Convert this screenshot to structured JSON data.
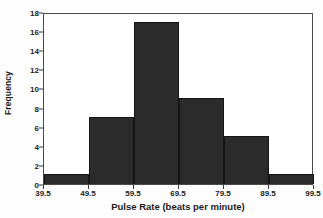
{
  "chart_data": {
    "type": "bar",
    "title": "",
    "xlabel": "Pulse Rate (beats per minute)",
    "ylabel": "Frequency",
    "categories": [
      "39.5-49.5",
      "49.5-59.5",
      "59.5-69.5",
      "69.5-79.5",
      "79.5-89.5",
      "89.5-99.5"
    ],
    "values": [
      1,
      7,
      17,
      9,
      5,
      1
    ],
    "bin_edges": [
      39.5,
      49.5,
      59.5,
      69.5,
      79.5,
      89.5,
      99.5
    ],
    "x_tick_labels": [
      "39.5",
      "49.5",
      "59.5",
      "69.5",
      "79.5",
      "89.5",
      "99.5"
    ],
    "y_tick_labels": [
      "0",
      "2",
      "4",
      "6",
      "8",
      "10",
      "12",
      "14",
      "16",
      "18"
    ],
    "y_ticks": [
      0,
      2,
      4,
      6,
      8,
      10,
      12,
      14,
      16,
      18
    ],
    "xlim": [
      39.5,
      99.5
    ],
    "ylim": [
      0,
      18
    ],
    "grid": false,
    "legend": false,
    "legend_position": "none",
    "bar_color": "#2b2b2b",
    "bar_edge_color": "#151515",
    "frame_color": "#4a4a4a",
    "background_color": "#ffffff",
    "text_color": "#1c1c1c"
  }
}
